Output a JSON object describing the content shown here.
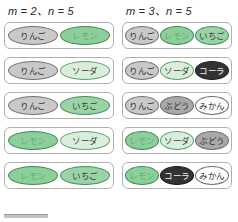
{
  "figure": {
    "columns": [
      {
        "heading": "m = 2、n = 5",
        "heading_m": "m",
        "heading_n": "n",
        "m_value": 2,
        "n_value": 5,
        "baskets": [
          {
            "items": [
              {
                "label": "りんご",
                "style": "gray-light"
              },
              {
                "label": "レモン",
                "style": "green"
              }
            ]
          },
          {
            "items": [
              {
                "label": "りんご",
                "style": "gray-light"
              },
              {
                "label": "ソーダ",
                "style": "green-pale"
              }
            ]
          },
          {
            "items": [
              {
                "label": "りんご",
                "style": "gray-light"
              },
              {
                "label": "いちご",
                "style": "green-mid"
              }
            ]
          },
          {
            "items": [
              {
                "label": "レモン",
                "style": "green"
              },
              {
                "label": "ソーダ",
                "style": "green-pale"
              }
            ]
          },
          {
            "items": [
              {
                "label": "レモン",
                "style": "green"
              },
              {
                "label": "いちご",
                "style": "green-mid"
              }
            ]
          }
        ]
      },
      {
        "heading": "m = 3、n = 5",
        "heading_m": "m",
        "heading_n": "n",
        "m_value": 3,
        "n_value": 5,
        "baskets": [
          {
            "items": [
              {
                "label": "りんご",
                "style": "gray-light"
              },
              {
                "label": "レモン",
                "style": "green"
              },
              {
                "label": "いちご",
                "style": "green-mid"
              }
            ]
          },
          {
            "items": [
              {
                "label": "りんご",
                "style": "gray-light"
              },
              {
                "label": "ソーダ",
                "style": "green-pale"
              },
              {
                "label": "コーラ",
                "style": "dark"
              }
            ]
          },
          {
            "items": [
              {
                "label": "りんご",
                "style": "gray-light"
              },
              {
                "label": "ぶどう",
                "style": "gray-mid"
              },
              {
                "label": "みかん",
                "style": "white"
              }
            ]
          },
          {
            "items": [
              {
                "label": "レモン",
                "style": "green"
              },
              {
                "label": "ソーダ",
                "style": "green-pale"
              },
              {
                "label": "ぶどう",
                "style": "gray-mid"
              }
            ]
          },
          {
            "items": [
              {
                "label": "レモン",
                "style": "green"
              },
              {
                "label": "コーラ",
                "style": "dark"
              },
              {
                "label": "みかん",
                "style": "white"
              }
            ]
          }
        ]
      }
    ],
    "colors": {
      "gray_light": "#c9c9c9",
      "gray_mid": "#a9a9a9",
      "green": "#8ccf9a",
      "green_pale": "#d9efdc",
      "green_mid": "#9bd3a6",
      "dark": "#333333",
      "white": "#ffffff",
      "card_border": "#b0b0b0"
    }
  }
}
